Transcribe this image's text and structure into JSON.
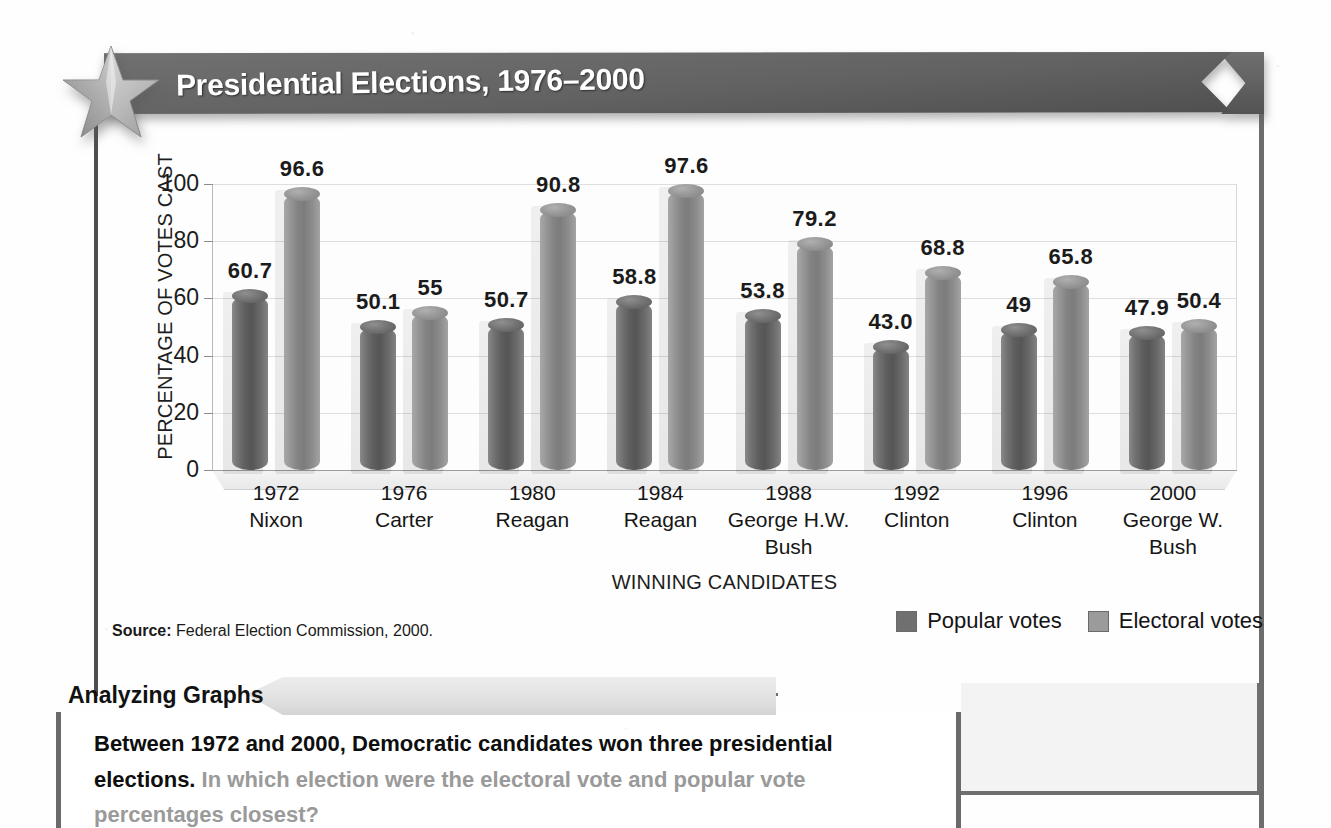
{
  "header": {
    "title": "Presidential Elections, 1976–2000",
    "star_icon": "star-icon"
  },
  "source": {
    "label": "Source:",
    "text": "Federal Election Commission, 2000."
  },
  "legend": {
    "popular_label": "Popular votes",
    "electoral_label": "Electoral votes",
    "popular_color": "#707070",
    "electoral_color": "#9b9b9b"
  },
  "caption": {
    "tab_label": "Analyzing Graphs",
    "lead": "Between 1972 and 2000, Democratic candidates won three presidential elections.",
    "question": "In which election were the electoral vote and popular vote percentages closest?"
  },
  "chart_data": {
    "type": "bar",
    "title": "Presidential Elections, 1976–2000",
    "xlabel": "WINNING CANDIDATES",
    "ylabel": "PERCENTAGE OF VOTES CAST",
    "ylim": [
      0,
      100
    ],
    "yticks": [
      0,
      20,
      40,
      60,
      80,
      100
    ],
    "grid": true,
    "legend_position": "bottom-right",
    "categories": [
      "1972",
      "1976",
      "1980",
      "1984",
      "1988",
      "1992",
      "1996",
      "2000"
    ],
    "candidates": [
      "Nixon",
      "Carter",
      "Reagan",
      "Reagan",
      "George H.W. Bush",
      "Clinton",
      "Clinton",
      "George W. Bush"
    ],
    "series": [
      {
        "name": "Popular votes",
        "values": [
          60.7,
          50.1,
          50.7,
          58.8,
          53.8,
          43.0,
          49,
          47.9
        ],
        "labels": [
          "60.7",
          "50.1",
          "50.7",
          "58.8",
          "53.8",
          "43.0",
          "49",
          "47.9"
        ]
      },
      {
        "name": "Electoral votes",
        "values": [
          96.6,
          55,
          90.8,
          97.6,
          79.2,
          68.8,
          65.8,
          50.4
        ],
        "labels": [
          "96.6",
          "55",
          "90.8",
          "97.6",
          "79.2",
          "68.8",
          "65.8",
          "50.4"
        ]
      }
    ]
  }
}
